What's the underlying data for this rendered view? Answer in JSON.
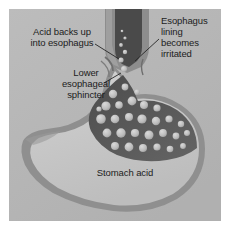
{
  "figure": {
    "background_color": "#ffffff",
    "panel_color": "#b6b6b6"
  },
  "labels": {
    "acid_backs_up": "Acid backs up\ninto esophagus",
    "esophagus_lining": "Esophagus\nlining\nbecomes\nirritated",
    "lower_esophageal_sphincter": "Lower\nesophageal\nsphincter",
    "stomach_acid": "Stomach acid"
  },
  "anatomy": {
    "esophagus_name": "esophagus",
    "esophagus_lumen_color": "#4b4b4b",
    "esophagus_wall_color": "#8d8d8d",
    "stomach_name": "stomach",
    "stomach_wall_color": "#8f8f8f",
    "stomach_body_color": "#c9c9c9",
    "acid_pool_name": "stomach-acid-pool",
    "acid_pool_color": "#575757",
    "bubble_name": "acid-bubble",
    "bubble_color": "#b9b9b9",
    "leader_line_color": "#2a2a2a"
  },
  "leader_lines": [
    {
      "name": "leader-acid-backs-up"
    },
    {
      "name": "leader-esophagus-lining"
    },
    {
      "name": "leader-lower-esophageal-sphincter"
    }
  ]
}
